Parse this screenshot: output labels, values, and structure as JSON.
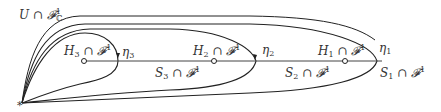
{
  "diagram": {
    "base_point": {
      "label": "*",
      "x": 22,
      "y": 103
    },
    "outer_region": {
      "label_main": "U ∩ ",
      "label_F": "𝓕",
      "label_sup": "1",
      "label_sub": "ℂ"
    },
    "line": {
      "y": 61,
      "x_start": 84,
      "x_end": 382
    },
    "points": [
      {
        "id": "H3",
        "label_main": "H",
        "label_idx": "3",
        "label_rest": " ∩ 𝓕",
        "label_sup": "1",
        "x": 84,
        "y": 61
      },
      {
        "id": "H2",
        "label_main": "H",
        "label_idx": "2",
        "label_rest": " ∩ 𝓕",
        "label_sup": "1",
        "x": 214,
        "y": 61
      },
      {
        "id": "H1",
        "label_main": "H",
        "label_idx": "1",
        "label_rest": " ∩ 𝓕",
        "label_sup": "1",
        "x": 345,
        "y": 61
      }
    ],
    "loops": [
      {
        "id": "eta3",
        "label": "η",
        "idx": "3"
      },
      {
        "id": "eta2",
        "label": "η",
        "idx": "2"
      },
      {
        "id": "eta1",
        "label": "η",
        "idx": "1"
      }
    ],
    "segments": [
      {
        "id": "S3",
        "label_main": "S",
        "label_idx": "3",
        "label_rest": " ∩ 𝓕",
        "label_sup": "1"
      },
      {
        "id": "S2",
        "label_main": "S",
        "label_idx": "2",
        "label_rest": " ∩ 𝓕",
        "label_sup": "1"
      },
      {
        "id": "S1",
        "label_main": "S",
        "label_idx": "1",
        "label_rest": " ∩ 𝓕",
        "label_sup": "1"
      }
    ],
    "colors": {
      "stroke": "#222222",
      "text": "#333333",
      "background": "#ffffff"
    }
  }
}
